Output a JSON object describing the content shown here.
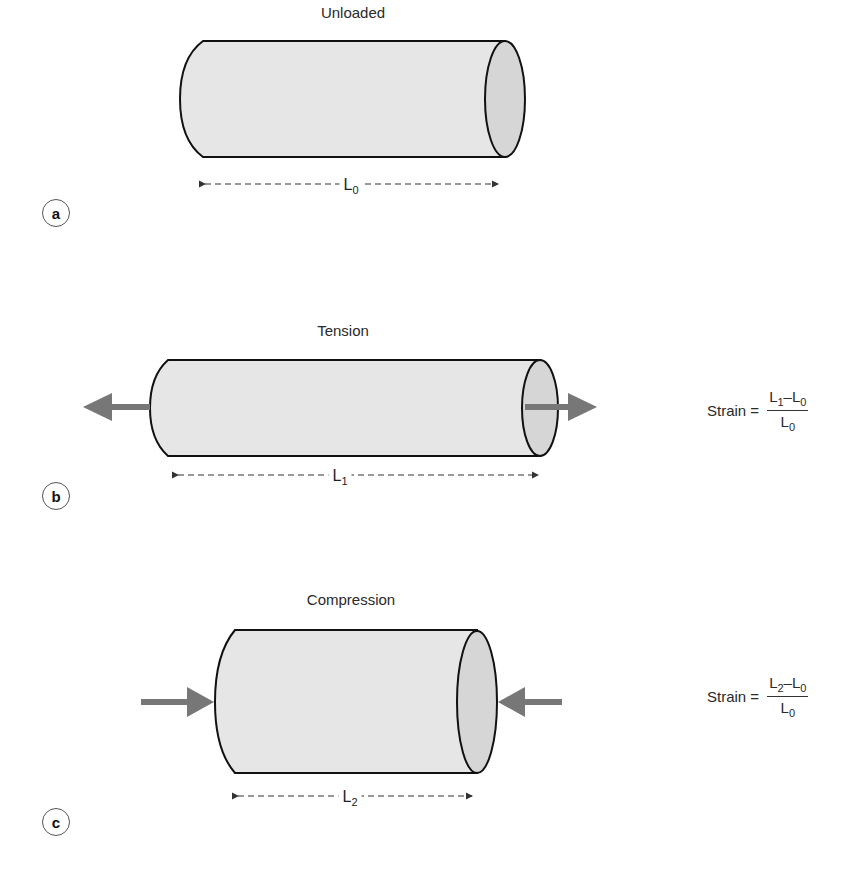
{
  "panels": [
    {
      "id": "a",
      "title": "Unloaded",
      "length_label": "L",
      "length_sub": "0"
    },
    {
      "id": "b",
      "title": "Tension",
      "length_label": "L",
      "length_sub": "1",
      "formula": {
        "lhs": "Strain =",
        "num_a": "L",
        "num_a_sub": "1",
        "minus": "–",
        "num_b": "L",
        "num_b_sub": "0",
        "den": "L",
        "den_sub": "0"
      }
    },
    {
      "id": "c",
      "title": "Compression",
      "length_label": "L",
      "length_sub": "2",
      "formula": {
        "lhs": "Strain =",
        "num_a": "L",
        "num_a_sub": "2",
        "minus": "–",
        "num_b": "L",
        "num_b_sub": "0",
        "den": "L",
        "den_sub": "0"
      }
    }
  ],
  "colors": {
    "body": "#e6e6e6",
    "end_face": "#d6d6d6",
    "outline": "#111111",
    "arrow": "#777777"
  }
}
